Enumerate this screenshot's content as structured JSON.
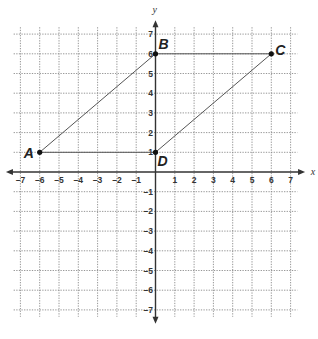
{
  "axes": {
    "x_label": "x",
    "y_label": "y",
    "x_ticks": [
      "-7",
      "-6",
      "-5",
      "-4",
      "-3",
      "-2",
      "-1",
      "1",
      "2",
      "3",
      "4",
      "5",
      "6",
      "7"
    ],
    "y_ticks": [
      "7",
      "6",
      "5",
      "4",
      "3",
      "2",
      "1",
      "-1",
      "-2",
      "-3",
      "-4",
      "-5",
      "-6",
      "-7"
    ],
    "range": {
      "x": [
        -7,
        7
      ],
      "y": [
        -7,
        7
      ]
    }
  },
  "points": [
    {
      "label": "A",
      "x": -6,
      "y": 1
    },
    {
      "label": "B",
      "x": 0,
      "y": 6
    },
    {
      "label": "C",
      "x": 6,
      "y": 6
    },
    {
      "label": "D",
      "x": 0,
      "y": 1
    }
  ],
  "shape": {
    "type": "parallelogram",
    "vertices": [
      "A",
      "B",
      "C",
      "D"
    ]
  },
  "colors": {
    "grid": "#8a8a8a",
    "axis": "#333333",
    "segment": "#555555"
  }
}
